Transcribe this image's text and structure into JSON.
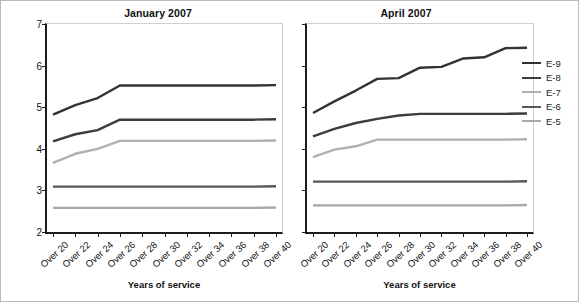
{
  "figure": {
    "axis_title_y": "Basic pay ($ thousands)",
    "axis_title_x": "Years of service"
  },
  "legend": {
    "position": "right",
    "items": [
      {
        "label": "E-9",
        "color": "#333333"
      },
      {
        "label": "E-8",
        "color": "#3c3c3c"
      },
      {
        "label": "E-7",
        "color": "#b0b0b0"
      },
      {
        "label": "E-6",
        "color": "#575757"
      },
      {
        "label": "E-5",
        "color": "#a8a8a8"
      }
    ]
  },
  "yticks": [
    "2",
    "3",
    "4",
    "5",
    "6",
    "7"
  ],
  "xticks": [
    "Over 20",
    "Over 22",
    "Over 24",
    "Over 26",
    "Over 28",
    "Over 30",
    "Over 32",
    "Over 34",
    "Over 36",
    "Over 38",
    "Over 40"
  ],
  "chart_data": [
    {
      "type": "line",
      "title": "January 2007",
      "xlabel": "Years of service",
      "ylabel": "Basic pay ($ thousands)",
      "ylim": [
        2,
        7
      ],
      "grid": false,
      "categories": [
        "Over 20",
        "Over 22",
        "Over 24",
        "Over 26",
        "Over 28",
        "Over 30",
        "Over 32",
        "Over 34",
        "Over 36",
        "Over 38",
        "Over 40"
      ],
      "series": [
        {
          "name": "E-9",
          "color": "#333333",
          "values": [
            4.82,
            5.05,
            5.22,
            5.52,
            5.52,
            5.52,
            5.52,
            5.52,
            5.52,
            5.52,
            5.53
          ]
        },
        {
          "name": "E-8",
          "color": "#3c3c3c",
          "values": [
            4.18,
            4.35,
            4.45,
            4.7,
            4.7,
            4.7,
            4.7,
            4.7,
            4.7,
            4.7,
            4.71
          ]
        },
        {
          "name": "E-7",
          "color": "#b0b0b0",
          "values": [
            3.66,
            3.88,
            4.0,
            4.19,
            4.19,
            4.19,
            4.19,
            4.19,
            4.19,
            4.19,
            4.2
          ]
        },
        {
          "name": "E-6",
          "color": "#575757",
          "values": [
            3.09,
            3.09,
            3.09,
            3.09,
            3.09,
            3.09,
            3.09,
            3.09,
            3.09,
            3.09,
            3.1
          ]
        },
        {
          "name": "E-5",
          "color": "#a8a8a8",
          "values": [
            2.58,
            2.58,
            2.58,
            2.58,
            2.58,
            2.58,
            2.58,
            2.58,
            2.58,
            2.58,
            2.59
          ]
        }
      ]
    },
    {
      "type": "line",
      "title": "April 2007",
      "xlabel": "Years of service",
      "ylabel": "Basic pay ($ thousands)",
      "ylim": [
        2,
        7
      ],
      "grid": false,
      "categories": [
        "Over 20",
        "Over 22",
        "Over 24",
        "Over 26",
        "Over 28",
        "Over 30",
        "Over 32",
        "Over 34",
        "Over 36",
        "Over 38",
        "Over 40"
      ],
      "series": [
        {
          "name": "E-9",
          "color": "#333333",
          "values": [
            4.86,
            5.14,
            5.4,
            5.68,
            5.7,
            5.95,
            5.97,
            6.17,
            6.2,
            6.42,
            6.43
          ]
        },
        {
          "name": "E-8",
          "color": "#3c3c3c",
          "values": [
            4.3,
            4.48,
            4.62,
            4.72,
            4.8,
            4.84,
            4.84,
            4.84,
            4.84,
            4.84,
            4.85
          ]
        },
        {
          "name": "E-7",
          "color": "#b0b0b0",
          "values": [
            3.8,
            3.98,
            4.06,
            4.22,
            4.22,
            4.22,
            4.22,
            4.22,
            4.22,
            4.22,
            4.23
          ]
        },
        {
          "name": "E-6",
          "color": "#575757",
          "values": [
            3.21,
            3.21,
            3.21,
            3.21,
            3.21,
            3.21,
            3.21,
            3.21,
            3.21,
            3.21,
            3.22
          ]
        },
        {
          "name": "E-5",
          "color": "#a8a8a8",
          "values": [
            2.64,
            2.64,
            2.64,
            2.64,
            2.64,
            2.64,
            2.64,
            2.64,
            2.64,
            2.64,
            2.65
          ]
        }
      ]
    }
  ]
}
